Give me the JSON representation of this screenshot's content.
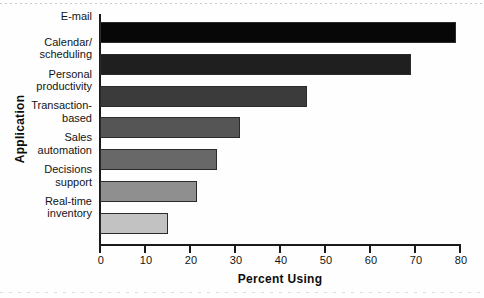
{
  "chart_data": {
    "type": "bar",
    "orientation": "horizontal",
    "title": "",
    "xlabel": "Percent Using",
    "ylabel": "Application",
    "xlim": [
      0,
      80
    ],
    "xticks": [
      0,
      10,
      20,
      30,
      40,
      50,
      60,
      70,
      80
    ],
    "xtick_labels": [
      "0",
      "10",
      "20",
      "30",
      "40",
      "50",
      "60",
      "70",
      "80"
    ],
    "grid": false,
    "legend": false,
    "categories": [
      "E-mail",
      "Calendar/ scheduling",
      "Personal productivity",
      "Transaction- based",
      "Sales automation",
      "Decisions support",
      "Real-time inventory"
    ],
    "category_lines": [
      [
        "E-mail"
      ],
      [
        "Calendar/",
        "scheduling"
      ],
      [
        "Personal",
        "productivity"
      ],
      [
        "Transaction-",
        "based"
      ],
      [
        "Sales",
        "automation"
      ],
      [
        "Decisions",
        "support"
      ],
      [
        "Real-time",
        "inventory"
      ]
    ],
    "values": [
      79,
      69,
      46,
      31,
      26,
      21.5,
      15
    ],
    "bar_colors": [
      "#070707",
      "#1f1f1f",
      "#3b3b3b",
      "#555555",
      "#686868",
      "#8f8f8f",
      "#c2c2c2"
    ]
  },
  "axis": {
    "x_title": "Percent Using",
    "y_title": "Application"
  }
}
